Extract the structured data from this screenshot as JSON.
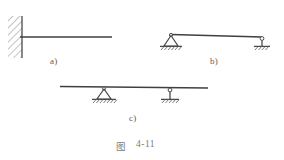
{
  "figure": {
    "caption_prefix": "图",
    "caption_number": "4-11",
    "caption_full": "图 4-11",
    "panels": [
      {
        "id": "a",
        "label": "a)",
        "name": "cantilever-beam",
        "description": "Cantilever beam fixed into a hatched wall at the left end, free at the right end",
        "beam": {
          "x1": 22,
          "y": 37,
          "x2": 112
        },
        "supports": [
          {
            "type": "fixed-wall",
            "position": "left",
            "x": 22,
            "y": 37
          }
        ],
        "wall": {
          "x_face": 22,
          "y_top": 16,
          "y_bottom": 58,
          "hatch_width": 14
        }
      },
      {
        "id": "b",
        "label": "b)",
        "name": "simply-supported-beam",
        "description": "Simply supported beam, pin support at left end and rocker/link support at right end",
        "beam": {
          "x1": 171,
          "y": 35,
          "x2": 262
        },
        "supports": [
          {
            "type": "pin-triangle",
            "position": "left",
            "x": 171,
            "y": 35
          },
          {
            "type": "rocker-link",
            "position": "right",
            "x": 262,
            "y": 37
          }
        ]
      },
      {
        "id": "c",
        "label": "c)",
        "name": "overhanging-beam",
        "description": "Overhanging beam resting on a pin support and a rocker/link support, with overhangs at both ends",
        "beam": {
          "x1": 60,
          "y": 87,
          "x2": 208
        },
        "supports": [
          {
            "type": "pin-triangle",
            "position": "inner-left",
            "x": 104,
            "y": 87
          },
          {
            "type": "rocker-link",
            "position": "inner-right",
            "x": 170,
            "y": 87
          }
        ]
      }
    ],
    "colors": {
      "line": "#4a4a4a",
      "beam": "#3f3f3f",
      "hatch": "#8a8a8a",
      "label_text": "#5d5d5d",
      "caption_text": "#7a7a7a",
      "background": "#ffffff"
    }
  }
}
